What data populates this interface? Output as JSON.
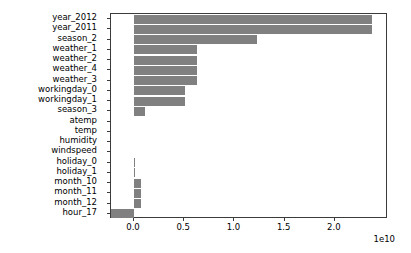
{
  "chart_data": {
    "type": "bar",
    "orientation": "horizontal",
    "title": "",
    "xlabel": "",
    "ylabel": "",
    "offset_text": "1e10",
    "offset_multiplier": 10000000000.0,
    "xlim": [
      -0.229,
      2.529
    ],
    "xticks": [
      0.0,
      0.5,
      1.0,
      1.5,
      2.0
    ],
    "xticklabels": [
      "0.0",
      "0.5",
      "1.0",
      "1.5",
      "2.0"
    ],
    "grid": false,
    "legend": null,
    "bar_color": "#808080",
    "categories": [
      "year_2012",
      "year_2011",
      "season_2",
      "weather_1",
      "weather_2",
      "weather_4",
      "weather_3",
      "workingday_0",
      "workingday_1",
      "season_3",
      "atemp",
      "temp",
      "humidity",
      "windspeed",
      "holiday_0",
      "holiday_1",
      "month_10",
      "month_11",
      "month_12",
      "hour_17"
    ],
    "values": [
      2.37,
      2.37,
      1.225,
      0.625,
      0.625,
      0.625,
      0.625,
      0.507,
      0.507,
      0.105,
      0.0,
      0.0,
      0.0,
      0.0,
      0.012,
      0.012,
      0.07,
      0.07,
      0.07,
      -0.229
    ],
    "value_units": "1e10"
  },
  "axes": {
    "tick_color": "#3b3b3b",
    "frame_color": "#3b3b3b",
    "background": "#ffffff"
  }
}
